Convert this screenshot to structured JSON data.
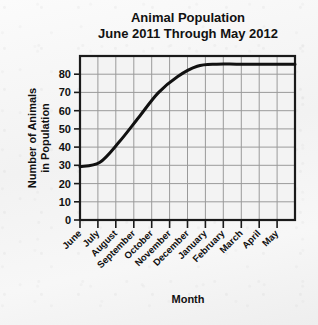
{
  "chart_data": {
    "type": "line",
    "title": "Animal Population",
    "subtitle": "June 2011 Through May 2012",
    "xlabel": "Month",
    "ylabel_line1": "Number of Animals",
    "ylabel_line2": "in Population",
    "categories": [
      "June",
      "July",
      "August",
      "September",
      "October",
      "November",
      "December",
      "January",
      "February",
      "March",
      "April",
      "May"
    ],
    "values": [
      26,
      28,
      38,
      50,
      62,
      70,
      75,
      76,
      76,
      76,
      76,
      76
    ],
    "series": [
      {
        "name": "Animal Population",
        "values": [
          26,
          28,
          38,
          50,
          62,
          70,
          75,
          76,
          76,
          76,
          76,
          76
        ]
      }
    ],
    "ylim": [
      0,
      80
    ],
    "y_ticks": [
      0,
      10,
      20,
      30,
      40,
      50,
      60,
      70,
      80
    ],
    "y_tick_labels": [
      "0",
      "10",
      "20",
      "30",
      "40",
      "50",
      "60",
      "70",
      "80"
    ],
    "grid": true,
    "legend": "none",
    "line_color": "#111111",
    "grid_color": "#9a9a9a",
    "frame_color": "#1a1a1a",
    "plot_background": "#f3f3f3",
    "page_background": "#f4f4f4"
  }
}
